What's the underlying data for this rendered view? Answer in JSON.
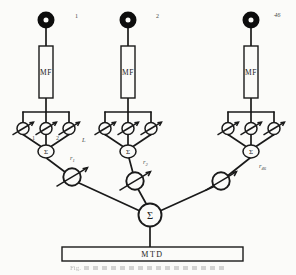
{
  "colors": {
    "ink": "#1a1a1a",
    "paper": "#fbfbf9",
    "label": "#4a4a4a"
  },
  "diagram": {
    "mf_label": "MF",
    "mtd_label": "MTD",
    "sum_symbol": "Σ",
    "antennas": [
      {
        "label": "1"
      },
      {
        "label": "2"
      },
      {
        "label": "46"
      }
    ],
    "tap_labels": [
      "1",
      "2",
      "L"
    ],
    "weights": [
      {
        "base": "r",
        "sub": "1"
      },
      {
        "base": "r",
        "sub": "2"
      },
      {
        "base": "r",
        "sub": "46"
      }
    ],
    "caption": {
      "text": "Fig."
    }
  }
}
